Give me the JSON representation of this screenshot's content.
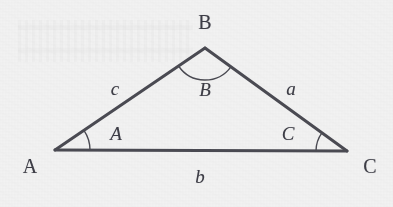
{
  "figure": {
    "kind": "geometry-diagram",
    "shape": "triangle",
    "background_color": "#f2f2f2",
    "stroke_color": "#4a4a52",
    "text_color": "#3d3d46",
    "stroke_width": 3,
    "arc_stroke_width": 1.4,
    "width": 393,
    "height": 207
  },
  "vertices": [
    {
      "id": "A",
      "label": "A",
      "x": 55,
      "y": 150,
      "label_x": 30,
      "label_y": 166
    },
    {
      "id": "B",
      "label": "B",
      "x": 205,
      "y": 48,
      "label_x": 205,
      "label_y": 22
    },
    {
      "id": "C",
      "label": "C",
      "x": 347,
      "y": 151,
      "label_x": 370,
      "label_y": 166
    }
  ],
  "angles": [
    {
      "id": "angle-A",
      "label": "A",
      "at_vertex": "A",
      "radius": 35,
      "label_x": 116,
      "label_y": 133
    },
    {
      "id": "angle-B",
      "label": "B",
      "at_vertex": "B",
      "radius": 32,
      "label_x": 205,
      "label_y": 89
    },
    {
      "id": "angle-C",
      "label": "C",
      "at_vertex": "C",
      "radius": 31,
      "label_x": 288,
      "label_y": 133
    }
  ],
  "sides": [
    {
      "id": "side-c",
      "label": "c",
      "from": "A",
      "to": "B",
      "label_x": 115,
      "label_y": 88
    },
    {
      "id": "side-a",
      "label": "a",
      "from": "B",
      "to": "C",
      "label_x": 291,
      "label_y": 88
    },
    {
      "id": "side-b",
      "label": "b",
      "from": "A",
      "to": "C",
      "label_x": 200,
      "label_y": 176
    }
  ]
}
